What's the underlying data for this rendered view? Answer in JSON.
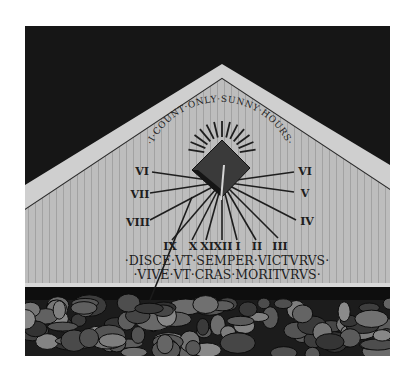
{
  "photo": {
    "subject": "Sundial painted on a wooden gable end above a stone wall",
    "motto_arc": "·I·COUNT·ONLY·SUNNY·HOURS·",
    "inscription": {
      "line1": "·DISCE·VT·SEMPER·VICTVRVS·",
      "line2": "·VIVE·VT·CRAS·MORITVRVS·"
    },
    "hour_numerals": {
      "left": [
        "VI",
        "VII",
        "VIII"
      ],
      "right": [
        "VI",
        "V",
        "IV"
      ],
      "bottom": [
        "IX",
        "X",
        "XI",
        "XII",
        "I",
        "II",
        "III"
      ]
    },
    "colors": {
      "sky": "#161616",
      "board": "#b9b9b9",
      "trim": "#cfcfcf",
      "ink": "#1e1e1e",
      "stone_dark": "#202020",
      "stone_light": "#8a8a8a"
    }
  }
}
